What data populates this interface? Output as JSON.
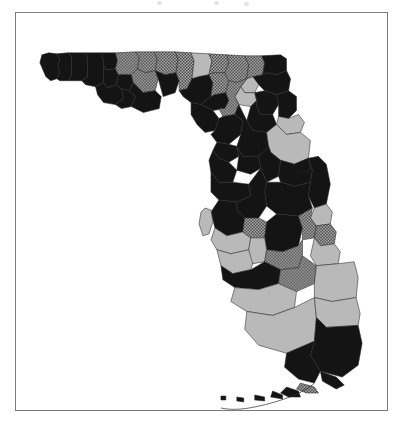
{
  "figure": {
    "domain": "map",
    "frame_border_color": "#7b7b7b",
    "background_color": "#ffffff"
  },
  "legend_categories": [
    {
      "key": "black",
      "label": "",
      "fill": "#141414",
      "pattern": "solid"
    },
    {
      "key": "gray",
      "label": "",
      "fill": "#b9b9b9",
      "pattern": "solid"
    },
    {
      "key": "check",
      "label": "",
      "fill": "#8f8f8f",
      "pattern": "checker"
    }
  ],
  "map_data": {
    "type": "choropleth",
    "region": "Florida",
    "outline_color": "#2a2a2a",
    "counties": [
      {
        "name": "escambia",
        "class": "black",
        "d": "M 26,42 L 33,40 L 41,41 L 44,46 L 42,54 L 44,60 L 41,66 L 35,68 L 30,64 L 27,57 L 24,50 Z"
      },
      {
        "name": "santa-rosa",
        "class": "black",
        "d": "M 44,46 L 41,41 L 52,40 L 56,44 L 56,62 L 52,68 L 44,68 L 41,66 L 44,60 L 42,54 Z"
      },
      {
        "name": "okaloosa",
        "class": "black",
        "d": "M 56,44 L 52,40 L 70,40 L 72,46 L 72,64 L 66,68 L 56,68 L 52,68 L 56,62 Z"
      },
      {
        "name": "walton",
        "class": "black",
        "d": "M 72,46 L 70,40 L 86,40 L 88,48 L 88,70 L 80,74 L 70,72 L 66,68 L 72,64 Z"
      },
      {
        "name": "holmes",
        "class": "black",
        "d": "M 88,48 L 86,40 L 100,40 L 102,48 L 100,56 L 90,57 L 88,52 Z"
      },
      {
        "name": "washington",
        "class": "black",
        "d": "M 88,52 L 90,57 L 100,56 L 103,62 L 101,72 L 92,75 L 88,70 Z"
      },
      {
        "name": "jackson",
        "class": "check",
        "d": "M 100,40 L 120,39 L 124,44 L 122,56 L 116,62 L 103,62 L 100,56 L 102,48 Z"
      },
      {
        "name": "bay",
        "class": "black",
        "d": "M 88,70 L 92,75 L 101,72 L 106,76 L 108,86 L 100,92 L 88,90 L 82,82 L 80,74 Z"
      },
      {
        "name": "calhoun",
        "class": "black",
        "d": "M 103,62 L 116,62 L 118,70 L 114,78 L 106,76 L 101,72 Z"
      },
      {
        "name": "gulf",
        "class": "black",
        "d": "M 106,76 L 114,78 L 120,84 L 116,94 L 106,96 L 100,92 L 108,86 Z"
      },
      {
        "name": "gadsden",
        "class": "check",
        "d": "M 124,44 L 120,39 L 139,39 L 142,46 L 140,58 L 130,60 L 122,56 Z"
      },
      {
        "name": "liberty",
        "class": "check",
        "d": "M 122,56 L 130,60 L 140,58 L 143,66 L 140,78 L 128,80 L 118,70 L 116,62 Z"
      },
      {
        "name": "franklin",
        "class": "black",
        "d": "M 118,70 L 128,80 L 140,78 L 146,84 L 144,96 L 128,100 L 120,96 L 116,94 L 120,84 L 114,78 Z"
      },
      {
        "name": "leon",
        "class": "check",
        "d": "M 142,46 L 139,39 L 160,39 L 163,46 L 161,60 L 150,62 L 140,58 Z"
      },
      {
        "name": "wakulla",
        "class": "black",
        "d": "M 140,58 L 150,62 L 161,60 L 164,68 L 160,80 L 148,84 L 143,66 Z"
      },
      {
        "name": "jefferson",
        "class": "check",
        "d": "M 163,46 L 160,39 L 176,40 L 179,48 L 177,66 L 172,76 L 164,78 L 164,68 L 161,60 Z"
      },
      {
        "name": "madison",
        "class": "gray",
        "d": "M 179,48 L 176,40 L 194,41 L 197,48 L 194,62 L 184,64 L 177,66 Z"
      },
      {
        "name": "taylor",
        "class": "black",
        "d": "M 177,66 L 184,64 L 194,62 L 198,70 L 196,84 L 186,92 L 176,90 L 168,84 L 164,78 L 172,76 Z"
      },
      {
        "name": "hamilton",
        "class": "check",
        "d": "M 197,48 L 194,41 L 212,42 L 214,50 L 210,60 L 199,60 L 194,62 Z"
      },
      {
        "name": "suwannee",
        "class": "check",
        "d": "M 194,62 L 199,60 L 210,60 L 214,68 L 211,80 L 200,82 L 196,84 L 198,70 Z"
      },
      {
        "name": "lafayette",
        "class": "black",
        "d": "M 196,84 L 200,82 L 211,80 L 214,88 L 210,96 L 198,98 L 190,94 L 186,92 Z"
      },
      {
        "name": "dixie",
        "class": "black",
        "d": "M 186,92 L 190,94 L 198,98 L 204,106 L 200,118 L 190,120 L 182,112 L 176,102 L 176,90 Z"
      },
      {
        "name": "columbia",
        "class": "check",
        "d": "M 214,50 L 212,42 L 230,43 L 234,52 L 232,66 L 222,70 L 214,68 L 210,60 Z"
      },
      {
        "name": "baker",
        "class": "check",
        "d": "M 234,52 L 230,43 L 247,43 L 250,50 L 248,62 L 238,64 L 232,66 Z"
      },
      {
        "name": "nassau",
        "class": "black",
        "d": "M 250,50 L 247,43 L 266,42 L 272,46 L 272,58 L 262,62 L 252,60 L 248,62 Z"
      },
      {
        "name": "duval",
        "class": "black",
        "d": "M 248,62 L 252,60 L 262,62 L 272,58 L 276,66 L 274,78 L 262,82 L 250,78 L 244,72 L 238,64 Z"
      },
      {
        "name": "union",
        "class": "gray",
        "d": "M 232,66 L 238,64 L 244,72 L 240,80 L 230,80 L 226,74 Z"
      },
      {
        "name": "bradford",
        "class": "gray",
        "d": "M 226,74 L 230,80 L 240,80 L 242,88 L 236,94 L 224,92 L 220,84 Z"
      },
      {
        "name": "clay",
        "class": "black",
        "d": "M 240,80 L 250,78 L 262,82 L 264,92 L 258,102 L 246,102 L 242,94 L 242,88 Z"
      },
      {
        "name": "st-johns",
        "class": "black",
        "d": "M 262,82 L 274,78 L 282,84 L 282,98 L 274,106 L 264,104 L 264,92 Z"
      },
      {
        "name": "alachua",
        "class": "check",
        "d": "M 214,68 L 222,70 L 232,66 L 226,74 L 220,84 L 224,92 L 220,102 L 208,104 L 204,96 L 210,96 L 214,88 L 211,80 Z"
      },
      {
        "name": "putnam",
        "class": "black",
        "d": "M 236,94 L 242,88 L 242,94 L 246,102 L 258,102 L 262,112 L 252,120 L 238,118 L 232,108 Z"
      },
      {
        "name": "levy",
        "class": "black",
        "d": "M 204,106 L 208,104 L 220,102 L 228,108 L 226,122 L 214,132 L 202,130 L 196,122 L 200,118 Z"
      },
      {
        "name": "marion",
        "class": "black",
        "d": "M 220,102 L 224,92 L 232,108 L 238,118 L 252,120 L 254,134 L 244,144 L 228,144 L 222,134 L 226,122 L 228,108 Z"
      },
      {
        "name": "flagler",
        "class": "gray",
        "d": "M 264,104 L 274,106 L 284,102 L 290,110 L 286,120 L 272,122 L 262,112 Z"
      },
      {
        "name": "volusia",
        "class": "gray",
        "d": "M 262,112 L 272,122 L 286,120 L 296,128 L 294,146 L 280,152 L 266,148 L 256,140 L 254,134 L 252,120 Z"
      },
      {
        "name": "citrus",
        "class": "black",
        "d": "M 202,130 L 214,132 L 222,134 L 224,144 L 214,150 L 204,146 L 198,138 Z"
      },
      {
        "name": "sumter",
        "class": "black",
        "d": "M 222,134 L 228,144 L 244,144 L 246,156 L 236,162 L 222,158 L 224,144 Z"
      },
      {
        "name": "lake",
        "class": "black",
        "d": "M 244,144 L 254,134 L 256,140 L 266,148 L 264,164 L 252,170 L 246,156 Z"
      },
      {
        "name": "hernando",
        "class": "black",
        "d": "M 198,138 L 204,146 L 214,150 L 222,158 L 218,170 L 204,170 L 196,160 L 194,148 Z"
      },
      {
        "name": "orange",
        "class": "black",
        "d": "M 266,148 L 280,152 L 294,146 L 298,158 L 296,170 L 280,174 L 266,170 L 264,164 Z"
      },
      {
        "name": "brevard",
        "class": "black",
        "d": "M 294,146 L 304,144 L 312,152 L 316,172 L 312,192 L 300,196 L 294,184 L 296,170 L 298,158 Z"
      },
      {
        "name": "seminole",
        "class": "black",
        "d": "M 280,152 L 294,146 L 296,158 L 284,160 L 278,156 Z"
      },
      {
        "name": "pasco",
        "class": "black",
        "d": "M 196,160 L 204,170 L 218,170 L 234,172 L 236,184 L 222,190 L 204,188 L 196,180 Z"
      },
      {
        "name": "osceola",
        "class": "black",
        "d": "M 252,170 L 266,170 L 280,174 L 296,170 L 294,184 L 298,196 L 284,204 L 262,202 L 252,194 L 250,180 Z"
      },
      {
        "name": "polk",
        "class": "black",
        "d": "M 234,172 L 246,156 L 252,170 L 250,180 L 252,194 L 244,206 L 230,206 L 222,198 L 222,190 L 236,184 Z"
      },
      {
        "name": "hillsborough",
        "class": "black",
        "d": "M 204,188 L 222,190 L 222,198 L 230,206 L 228,220 L 212,224 L 200,216 L 196,200 Z"
      },
      {
        "name": "pinellas",
        "class": "gray",
        "d": "M 190,196 L 196,198 L 198,210 L 194,222 L 188,224 L 184,212 L 186,200 Z"
      },
      {
        "name": "manatee",
        "class": "gray",
        "d": "M 200,216 L 212,224 L 228,220 L 236,226 L 234,238 L 216,242 L 202,238 L 196,228 Z"
      },
      {
        "name": "hardee",
        "class": "check",
        "d": "M 230,206 L 244,206 L 252,210 L 250,226 L 236,226 L 228,220 Z"
      },
      {
        "name": "highlands",
        "class": "black",
        "d": "M 250,226 L 252,210 L 262,202 L 284,204 L 288,216 L 284,234 L 268,240 L 252,238 Z"
      },
      {
        "name": "indian-river",
        "class": "gray",
        "d": "M 300,196 L 312,192 L 318,200 L 316,212 L 302,214 L 296,206 Z"
      },
      {
        "name": "okeechobee",
        "class": "check",
        "d": "M 284,204 L 298,196 L 296,206 L 302,214 L 300,226 L 288,228 L 288,216 Z"
      },
      {
        "name": "st-lucie",
        "class": "check",
        "d": "M 302,214 L 316,212 L 322,220 L 320,232 L 306,234 L 300,226 Z"
      },
      {
        "name": "martin",
        "class": "gray",
        "d": "M 300,226 L 306,234 L 320,232 L 326,240 L 324,252 L 302,254 L 296,244 Z"
      },
      {
        "name": "sarasota",
        "class": "gray",
        "d": "M 202,238 L 216,242 L 234,238 L 240,246 L 236,258 L 218,262 L 206,254 Z"
      },
      {
        "name": "desoto",
        "class": "gray",
        "d": "M 236,226 L 250,226 L 252,238 L 250,250 L 238,252 L 234,238 Z"
      },
      {
        "name": "glades",
        "class": "check",
        "d": "M 252,238 L 268,240 L 284,234 L 288,228 L 288,244 L 284,256 L 266,258 L 250,250 Z"
      },
      {
        "name": "charlotte",
        "class": "black",
        "d": "M 206,254 L 218,262 L 236,258 L 250,250 L 266,258 L 264,272 L 244,278 L 220,276 L 208,268 Z"
      },
      {
        "name": "hendry",
        "class": "check",
        "d": "M 266,258 L 284,256 L 288,244 L 302,254 L 300,272 L 282,280 L 264,272 Z"
      },
      {
        "name": "palm-beach",
        "class": "gray",
        "d": "M 302,254 L 324,252 L 340,250 L 344,266 L 342,286 L 318,290 L 300,286 L 300,272 Z"
      },
      {
        "name": "lee",
        "class": "gray",
        "d": "M 220,276 L 244,278 L 264,272 L 282,280 L 280,296 L 258,304 L 232,300 L 216,290 Z"
      },
      {
        "name": "collier",
        "class": "gray",
        "d": "M 232,300 L 258,304 L 280,296 L 300,286 L 302,306 L 300,330 L 272,342 L 244,334 L 230,318 Z"
      },
      {
        "name": "broward",
        "class": "gray",
        "d": "M 300,286 L 318,290 L 342,286 L 346,302 L 344,314 L 312,316 L 302,306 Z"
      },
      {
        "name": "miami-dade",
        "class": "black",
        "d": "M 302,306 L 312,316 L 344,314 L 348,332 L 344,354 L 328,366 L 306,360 L 296,344 L 300,330 Z"
      },
      {
        "name": "monroe-main",
        "class": "black",
        "d": "M 272,342 L 300,330 L 296,344 L 306,360 L 300,372 L 284,368 L 270,356 Z"
      }
    ],
    "keys_islands": [
      {
        "name": "key-largo",
        "class": "black",
        "d": "M 306,360 L 322,366 L 330,374 L 322,378 L 308,370 Z"
      },
      {
        "name": "upper-keys-a",
        "class": "check",
        "d": "M 286,372 L 300,376 L 304,382 L 292,382 L 282,378 Z"
      },
      {
        "name": "upper-keys-b",
        "class": "black",
        "d": "M 272,376 L 284,380 L 286,386 L 274,386 L 266,382 Z"
      },
      {
        "name": "middle-keys",
        "class": "black",
        "d": "M 258,380 L 268,384 L 268,388 L 256,386 Z"
      },
      {
        "name": "lower-keys",
        "class": "black",
        "d": "M 240,384 L 250,386 L 250,390 L 240,389 Z"
      },
      {
        "name": "key-west",
        "class": "black",
        "d": "M 222,386 L 229,387 L 229,391 L 222,390 Z"
      },
      {
        "name": "dry-tortugas",
        "class": "black",
        "d": "M 206,385 L 211,385 L 211,389 L 206,389 Z"
      }
    ],
    "keys_arc_outline": "M 300,372 C 292,380 270,390 240,396 C 226,399 214,399 206,397"
  },
  "scan_artifacts": [
    {
      "x": 157,
      "y": 1
    },
    {
      "x": 214,
      "y": 1
    },
    {
      "x": 244,
      "y": 2
    }
  ]
}
